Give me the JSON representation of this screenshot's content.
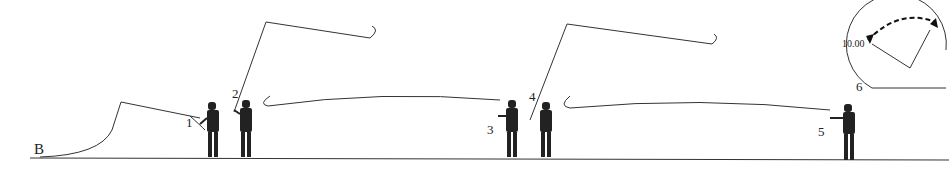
{
  "figure": {
    "corner_label": "B",
    "steps": [
      {
        "number": "1"
      },
      {
        "number": "2"
      },
      {
        "number": "3"
      },
      {
        "number": "4"
      },
      {
        "number": "5"
      },
      {
        "number": "6"
      }
    ],
    "clock_inset": {
      "time_label": "10.00",
      "label": "6"
    }
  }
}
